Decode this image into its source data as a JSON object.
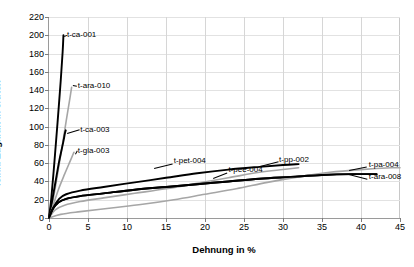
{
  "chart_data": {
    "type": "line",
    "title": "",
    "xlabel": "Dehnung in %",
    "ylabel": "feinh. Zugkraft in cN/tex",
    "xlim": [
      0,
      45
    ],
    "ylim": [
      0,
      220
    ],
    "xticks": [
      0,
      5,
      10,
      15,
      20,
      25,
      30,
      35,
      40,
      45
    ],
    "yticks": [
      0,
      20,
      40,
      60,
      80,
      100,
      120,
      140,
      160,
      180,
      200,
      220
    ],
    "grid": true,
    "legend_position": "inline-labels",
    "series": [
      {
        "name": "t-ca-001",
        "color": "#000000",
        "label": "t-ca-001",
        "points": [
          [
            0,
            0
          ],
          [
            0.3,
            22
          ],
          [
            0.7,
            62
          ],
          [
            1.1,
            105
          ],
          [
            1.5,
            150
          ],
          [
            1.75,
            182
          ],
          [
            1.85,
            200
          ]
        ]
      },
      {
        "name": "t-ara-010",
        "color": "#a6a6a6",
        "label": "t-ara-010",
        "points": [
          [
            0,
            0
          ],
          [
            0.4,
            14
          ],
          [
            1.0,
            43
          ],
          [
            1.6,
            74
          ],
          [
            2.2,
            106
          ],
          [
            2.7,
            132
          ],
          [
            2.9,
            143
          ]
        ]
      },
      {
        "name": "t-ca-003",
        "color": "#000000",
        "label": "t-ca-003",
        "points": [
          [
            0,
            0
          ],
          [
            0.3,
            14
          ],
          [
            0.8,
            38
          ],
          [
            1.3,
            62
          ],
          [
            1.8,
            82
          ],
          [
            2.05,
            93
          ],
          [
            2.15,
            96
          ]
        ]
      },
      {
        "name": "t-gla-003",
        "color": "#a6a6a6",
        "label": "t-gla-003",
        "points": [
          [
            0,
            0
          ],
          [
            0.5,
            13
          ],
          [
            1.2,
            31
          ],
          [
            2.0,
            48
          ],
          [
            2.7,
            62
          ],
          [
            3.1,
            70
          ],
          [
            3.2,
            72
          ]
        ]
      },
      {
        "name": "t-pet-004",
        "color": "#000000",
        "label": "t-pet-004",
        "points": [
          [
            0,
            0
          ],
          [
            0.6,
            12
          ],
          [
            1.3,
            21
          ],
          [
            2.2,
            26
          ],
          [
            4,
            30
          ],
          [
            7,
            34
          ],
          [
            11,
            39
          ],
          [
            15,
            44
          ],
          [
            19,
            49
          ],
          [
            23,
            53
          ],
          [
            27,
            56
          ],
          [
            30,
            58
          ],
          [
            32,
            59
          ]
        ]
      },
      {
        "name": "t-pp-002",
        "color": "#a6a6a6",
        "label": "t-pp-002",
        "points": [
          [
            0,
            0
          ],
          [
            0.8,
            9
          ],
          [
            2,
            14
          ],
          [
            4,
            18
          ],
          [
            7,
            22
          ],
          [
            11,
            27
          ],
          [
            15,
            32
          ],
          [
            19,
            38
          ],
          [
            23,
            44
          ],
          [
            27,
            50
          ],
          [
            30,
            53
          ],
          [
            32,
            55
          ]
        ]
      },
      {
        "name": "t-pee-004",
        "color": "#000000",
        "label": "t-pee-004",
        "points": [
          [
            0,
            0
          ],
          [
            0.5,
            10
          ],
          [
            1.2,
            17
          ],
          [
            2.2,
            21
          ],
          [
            4,
            24
          ],
          [
            7,
            27
          ],
          [
            11,
            31
          ],
          [
            15,
            34
          ],
          [
            19,
            37
          ],
          [
            23,
            40
          ],
          [
            27,
            43
          ],
          [
            31,
            45
          ],
          [
            35,
            47
          ],
          [
            39,
            48
          ],
          [
            42,
            48
          ]
        ]
      },
      {
        "name": "t-pa-004",
        "color": "#a6a6a6",
        "label": "t-pa-004",
        "points": [
          [
            0,
            0
          ],
          [
            1.5,
            4
          ],
          [
            4,
            7
          ],
          [
            8,
            11
          ],
          [
            12,
            15
          ],
          [
            16,
            20
          ],
          [
            20,
            26
          ],
          [
            24,
            32
          ],
          [
            28,
            39
          ],
          [
            32,
            45
          ],
          [
            36,
            50
          ],
          [
            40,
            53
          ],
          [
            44,
            55
          ],
          [
            45,
            55
          ]
        ]
      },
      {
        "name": "t-ara-008",
        "color": "#000000",
        "label": "t-ara-008",
        "points": [
          [
            0,
            0
          ],
          [
            0.5,
            10
          ],
          [
            1.2,
            17
          ],
          [
            2.2,
            21
          ],
          [
            4,
            24
          ],
          [
            7,
            27
          ],
          [
            11,
            31
          ],
          [
            15,
            34
          ],
          [
            19,
            37
          ],
          [
            23,
            40
          ],
          [
            27,
            43
          ],
          [
            31,
            45
          ],
          [
            35,
            47
          ],
          [
            39,
            48
          ],
          [
            42,
            48
          ]
        ]
      }
    ],
    "annotations": [
      {
        "text": "t-ca-001",
        "x": 2.3,
        "y": 200
      },
      {
        "text": "t-ara-010",
        "x": 3.7,
        "y": 144
      },
      {
        "text": "t-ca-003",
        "x": 4.0,
        "y": 96
      },
      {
        "text": "t-gla-003",
        "x": 3.7,
        "y": 73
      },
      {
        "text": "t-pet-004",
        "x": 16.0,
        "y": 62
      },
      {
        "text": "t-pp-002",
        "x": 29.5,
        "y": 64
      },
      {
        "text": "t-pee-004",
        "x": 23.0,
        "y": 52
      },
      {
        "text": "t-pa-004",
        "x": 41.0,
        "y": 58
      },
      {
        "text": "t-ara-008",
        "x": 41.0,
        "y": 45
      }
    ]
  }
}
